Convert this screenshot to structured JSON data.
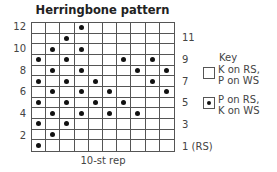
{
  "title": "Herringbone pattern",
  "chart_data": {
    "type": "table",
    "title": "Herringbone pattern",
    "columns": 10,
    "rows": 12,
    "xlabel": "10-st rep",
    "row_labels_left": [
      "12",
      "10",
      "8",
      "6",
      "4",
      "2"
    ],
    "row_labels_right": [
      "11",
      "9",
      "7",
      "5",
      "3",
      "1 (RS)"
    ],
    "purl_cells_by_row": {
      "12": [
        4
      ],
      "11": [
        3
      ],
      "10": [
        2,
        4
      ],
      "9": [
        1,
        3,
        7,
        9
      ],
      "8": [
        2,
        4,
        8,
        10
      ],
      "7": [
        1,
        3,
        5,
        9
      ],
      "6": [
        2,
        4,
        6,
        10
      ],
      "5": [
        1,
        3,
        5,
        7
      ],
      "4": [
        2,
        4,
        6,
        8
      ],
      "3": [
        1,
        3
      ],
      "2": [
        2
      ],
      "1": [
        1
      ]
    },
    "legend": [
      {
        "symbol": "empty-square",
        "label": "K on RS, P on WS"
      },
      {
        "symbol": "dot-square",
        "label": "P on RS, K on WS"
      }
    ]
  },
  "rep_label": "10-st rep",
  "key": {
    "title": "Key",
    "items": [
      {
        "label": "K on RS,\nP on WS"
      },
      {
        "label": "P on RS,\nK on WS"
      }
    ]
  },
  "labels": {
    "left": [
      {
        "text": "12",
        "row": 12
      },
      {
        "text": "10",
        "row": 10
      },
      {
        "text": "8",
        "row": 8
      },
      {
        "text": "6",
        "row": 6
      },
      {
        "text": "4",
        "row": 4
      },
      {
        "text": "2",
        "row": 2
      }
    ],
    "right": [
      {
        "text": "11",
        "row": 11
      },
      {
        "text": "9",
        "row": 9
      },
      {
        "text": "7",
        "row": 7
      },
      {
        "text": "5",
        "row": 5
      },
      {
        "text": "3",
        "row": 3
      },
      {
        "text": "1 (RS)",
        "row": 1
      }
    ]
  }
}
